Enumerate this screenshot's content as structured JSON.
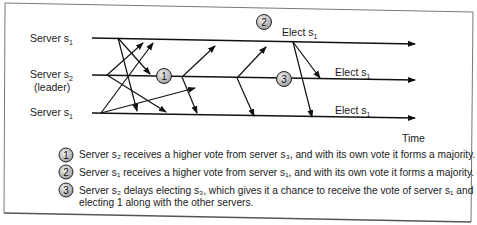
{
  "diagram": {
    "servers": [
      {
        "label": "Server s",
        "sub": "1",
        "extra": ""
      },
      {
        "label": "Server s",
        "sub": "2",
        "extra": "(leader)"
      },
      {
        "label": "Server s",
        "sub": "1",
        "extra": ""
      }
    ],
    "elect_labels": [
      {
        "text": "Elect s",
        "sub": "1"
      },
      {
        "text": "Elect s",
        "sub": "1"
      },
      {
        "text": "Elect s",
        "sub": "1"
      }
    ],
    "markers": [
      "1",
      "2",
      "3"
    ],
    "time_label": "Time",
    "notes": [
      {
        "num": "1",
        "lines": [
          "Server s₂ receives a higher vote from server s₃, and with its own vote it forms a majority."
        ]
      },
      {
        "num": "2",
        "lines": [
          "Server s₁ receives a higher vote from server s₁, and with its own vote it forms a majority."
        ]
      },
      {
        "num": "3",
        "lines": [
          "Server s₂ delays electing s₃, which gives it a chance to receive the vote of server s₁ and",
          "electing 1 along with the other servers."
        ]
      }
    ]
  }
}
